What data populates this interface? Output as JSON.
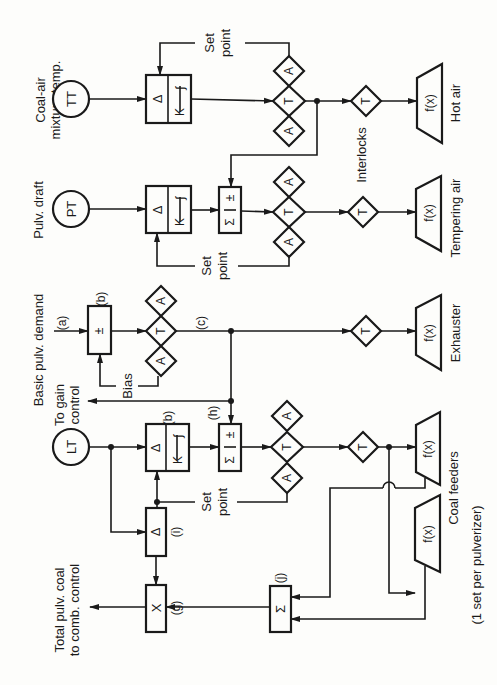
{
  "figure": {
    "type": "pulverizer control block diagram",
    "orientation": "rotated 90 degrees counter-clockwise",
    "colors": {
      "line": "#1a1a1a",
      "background": "#fdfdfb"
    }
  },
  "transmitters": {
    "tt": {
      "symbol": "TT",
      "label_line1": "Coal-air",
      "label_line2": "mixture temp."
    },
    "pt": {
      "symbol": "PT",
      "label": "Pulv. draft"
    },
    "lt": {
      "symbol": "LT"
    }
  },
  "blocks": {
    "delta": "Δ",
    "k": "K",
    "integral": "∫",
    "sigma": "Σ",
    "plusminus": "±",
    "multiply": "X",
    "transfer": "T",
    "auto": "A",
    "function": "f(x)"
  },
  "labels": {
    "set_point_line1": "Set",
    "set_point_line2": "point",
    "basic_demand": "Basic pulv. demand",
    "bias": "Bias",
    "to_gain_line1": "To gain",
    "to_gain_line2": "control",
    "interlocks": "Interlocks",
    "total_line1": "Total pulv. coal",
    "total_line2": "to comb. control",
    "hot_air": "Hot air",
    "tempering_air": "Tempering air",
    "exhauster": "Exhauster",
    "coal_feeders": "Coal feeders",
    "per_pulverizer": "(1 set per pulverizer)"
  },
  "tags": {
    "a": "(a)",
    "b": "(b)",
    "c": "(c)",
    "g": "(g)",
    "h": "(h)",
    "i": "(i)",
    "j": "(j)"
  }
}
